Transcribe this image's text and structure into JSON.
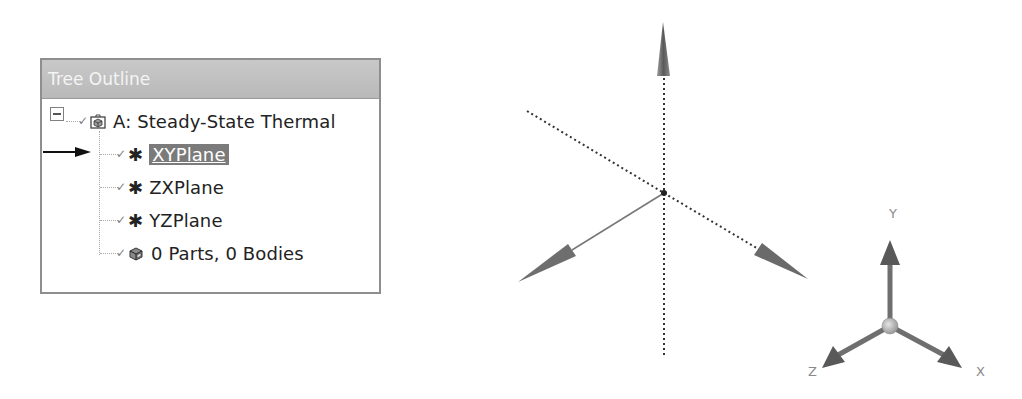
{
  "tree_outline": {
    "title": "Tree Outline",
    "root": {
      "label": "A: Steady-State Thermal",
      "icon": "analysis-system-icon",
      "expanded": true
    },
    "children": [
      {
        "label": "XYPlane",
        "icon": "plane-icon",
        "selected": true,
        "checked": true
      },
      {
        "label": "ZXPlane",
        "icon": "plane-icon",
        "selected": false,
        "checked": true
      },
      {
        "label": "YZPlane",
        "icon": "plane-icon",
        "selected": false,
        "checked": true
      },
      {
        "label": "0 Parts, 0 Bodies",
        "icon": "parts-icon",
        "selected": false,
        "checked": true
      }
    ]
  },
  "pointer": {
    "target": "XYPlane",
    "icon": "arrow-right-icon"
  },
  "viewport": {
    "triad": {
      "x_label": "X",
      "y_label": "Y",
      "z_label": "Z"
    }
  },
  "colors": {
    "header_bg": "#bfbfbf",
    "selection_bg": "#7b7b7b",
    "axis_gray": "#777777"
  }
}
